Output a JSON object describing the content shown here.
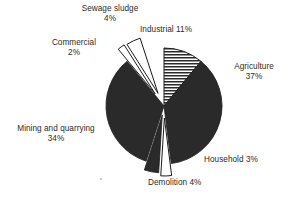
{
  "chart_data": {
    "type": "pie",
    "title": "",
    "subtitle": "",
    "xlabel": "",
    "ylabel": "",
    "units": "percent",
    "legend_position": "none",
    "grid": false,
    "label_format": "{name} {value}%",
    "total": 100,
    "start_angle_deg": 0,
    "direction": "clockwise",
    "categories": [
      "Industrial",
      "Agriculture",
      "Household",
      "Demolition",
      "Mining and quarrying",
      "Commercial",
      "Sewage sludge"
    ],
    "values": [
      11,
      37,
      3,
      4,
      34,
      2,
      4
    ],
    "slices": [
      {
        "name": "Industrial",
        "value": 11,
        "value_text": "11%",
        "label_lines": [
          "Industrial 11%"
        ],
        "fill": "horizontal-hatch",
        "fill_color": "#2a2a2a",
        "stroke": "#1c1c1c",
        "exploded": false,
        "explode_distance": 0
      },
      {
        "name": "Agriculture",
        "value": 37,
        "value_text": "37%",
        "label_lines": [
          "Agriculture",
          "37%"
        ],
        "fill": "solid",
        "fill_color": "#2a2a2a",
        "stroke": "#1c1c1c",
        "exploded": false,
        "explode_distance": 0
      },
      {
        "name": "Household",
        "value": 3,
        "value_text": "3%",
        "label_lines": [
          "Household 3%"
        ],
        "fill": "solid",
        "fill_color": "#ffffff",
        "stroke": "#1c1c1c",
        "exploded": true,
        "explode_distance": 12
      },
      {
        "name": "Demolition",
        "value": 4,
        "value_text": "4%",
        "label_lines": [
          "Demolition 4%"
        ],
        "fill": "solid",
        "fill_color": "#2a2a2a",
        "stroke": "#1c1c1c",
        "exploded": true,
        "explode_distance": 9
      },
      {
        "name": "Mining and quarrying",
        "value": 34,
        "value_text": "34%",
        "label_lines": [
          "Mining and quarrying",
          "34%"
        ],
        "fill": "solid",
        "fill_color": "#2a2a2a",
        "stroke": "#1c1c1c",
        "exploded": false,
        "explode_distance": 0
      },
      {
        "name": "Commercial",
        "value": 2,
        "value_text": "2%",
        "label_lines": [
          "Commercial",
          "2%"
        ],
        "fill": "solid",
        "fill_color": "#ffffff",
        "stroke": "#1c1c1c",
        "exploded": true,
        "explode_distance": 15
      },
      {
        "name": "Sewage sludge",
        "value": 4,
        "value_text": "4%",
        "label_lines": [
          "Sewage sludge",
          "4%"
        ],
        "fill": "solid",
        "fill_color": "#ffffff",
        "stroke": "#1c1c1c",
        "exploded": true,
        "explode_distance": 14
      }
    ]
  },
  "labels": {
    "sewage_line1": "Sewage sludge",
    "sewage_line2": "4%",
    "industrial_line1": "Industrial 11%",
    "commercial_line1": "Commercial",
    "commercial_line2": "2%",
    "agriculture_line1": "Agriculture",
    "agriculture_line2": "37%",
    "mining_line1": "Mining and quarrying",
    "mining_line2": "34%",
    "household_line1": "Household 3%",
    "demolition_line1": "Demolition 4%"
  },
  "style": {
    "background": "#ffffff",
    "ink": "#2b2b2b",
    "slice_dark": "#2a2a2a",
    "slice_light": "#ffffff",
    "outline": "#1c1c1c"
  }
}
